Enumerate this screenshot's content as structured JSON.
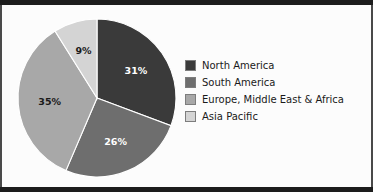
{
  "chart_data": {
    "type": "pie",
    "title": "",
    "categories": [
      "North America",
      "South America",
      "Europe, Middle East & Africa",
      "Asia Pacific"
    ],
    "values": [
      31,
      26,
      35,
      9
    ],
    "value_labels": [
      "31%",
      "26%",
      "35%",
      "9%"
    ],
    "colors": [
      "#3a3a3a",
      "#6e6e6e",
      "#a8a8a8",
      "#d4d4d4"
    ],
    "label_colors": [
      "#ffffff",
      "#ffffff",
      "#1a1a1a",
      "#1a1a1a"
    ],
    "start_angle_deg": 0,
    "direction": "clockwise",
    "legend_position": "right",
    "grid": false,
    "xlabel": "",
    "ylabel": ""
  },
  "legend": {
    "items": [
      {
        "label": "North America",
        "color": "#3a3a3a"
      },
      {
        "label": "South America",
        "color": "#6e6e6e"
      },
      {
        "label": "Europe, Middle East & Africa",
        "color": "#a8a8a8"
      },
      {
        "label": "Asia Pacific",
        "color": "#d4d4d4"
      }
    ]
  },
  "slice_labels": {
    "north_america": "31%",
    "south_america": "26%",
    "europe_mea": "35%",
    "asia_pacific": "9%"
  }
}
